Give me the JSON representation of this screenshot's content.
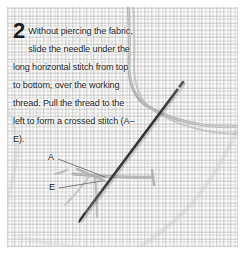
{
  "figure": {
    "name": "cross-stitch-step-2-photo",
    "width": 244,
    "height": 253,
    "background": "#ffffff"
  },
  "caption": {
    "step_number": "2",
    "text": "Without piercing the fabric, slide the needle under the long horizontal stitch from top to bottom, over the working thread. Pull the thread to the left to form a crossed stitch (A–E).",
    "lines": [
      "Without piercing the",
      "fabric, slide the needle",
      "under the long horizontal",
      "stitch from top to bottom,",
      "over the working thread.",
      "Pull the thread to the left to",
      "form a crossed stitch (A–E)."
    ],
    "text_color": "#1b1b1b"
  },
  "callouts": [
    {
      "id": "a",
      "label": "A",
      "x": 48,
      "y": 152,
      "leader_to_x": 104,
      "leader_to_y": 175
    },
    {
      "id": "e",
      "label": "E",
      "x": 49,
      "y": 182,
      "leader_to_x": 101,
      "leader_to_y": 185
    }
  ],
  "scene": {
    "fabric": {
      "name": "aida-cloth-swatch",
      "description": "white even-weave cross stitch fabric with fine grid texture",
      "color": "#fdfdfc",
      "weave_color": "#b0b2b0"
    },
    "needle": {
      "name": "tapestry-needle",
      "color": "#3b3b40",
      "from_x": 183,
      "from_y": 82,
      "to_x": 80,
      "to_y": 220
    },
    "working_thread": {
      "name": "working-thread",
      "color": "#a9aaa8",
      "description": "pale grey floss curving from top of frame down and sweeping to the right edge"
    },
    "horizontal_stitch": {
      "name": "long-horizontal-stitch",
      "color": "#a0a2a0",
      "from_x": 74,
      "from_y": 174,
      "to_x": 152,
      "to_y": 177
    },
    "vertical_stitch": {
      "name": "vertical-thread-leg",
      "color": "#b4b6b4",
      "from_x": 95,
      "from_y": 176,
      "to_x": 97,
      "to_y": 215
    },
    "edge_shadow_color": "#c9cac8"
  }
}
